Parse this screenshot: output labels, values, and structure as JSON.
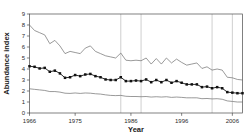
{
  "chart_data": {
    "type": "line",
    "title": "",
    "xlabel": "Year",
    "ylabel": "Abundance index",
    "xlim": [
      1966,
      2008
    ],
    "ylim": [
      0,
      9
    ],
    "grid": "vertical",
    "legend": "none",
    "x": [
      1966,
      1967,
      1968,
      1969,
      1970,
      1971,
      1972,
      1973,
      1974,
      1975,
      1976,
      1977,
      1978,
      1979,
      1980,
      1981,
      1982,
      1983,
      1984,
      1985,
      1986,
      1987,
      1988,
      1989,
      1990,
      1991,
      1992,
      1993,
      1994,
      1995,
      1996,
      1997,
      1998,
      1999,
      2000,
      2001,
      2002,
      2003,
      2004,
      2005,
      2006,
      2007,
      2008
    ],
    "xticks": [
      1966,
      1975,
      1986,
      1996,
      2006
    ],
    "xticklabels": [
      "1966",
      "1975",
      "1986",
      "1996",
      "2006"
    ],
    "yticks": [
      0,
      1,
      2,
      3,
      4,
      5,
      6,
      7,
      8,
      9
    ],
    "yticklabels": [
      "0",
      "1",
      "2",
      "3",
      "4",
      "5",
      "6",
      "7",
      "8",
      "9"
    ],
    "vertical_gridlines": [
      1984,
      1988,
      2002,
      2006
    ],
    "series": [
      {
        "name": "upper-confidence-bound",
        "marker": "none",
        "color": "#6e6e6e",
        "values": [
          8.0,
          7.5,
          7.3,
          7.1,
          6.3,
          6.6,
          6.1,
          5.4,
          5.6,
          5.5,
          5.4,
          5.9,
          6.1,
          5.6,
          5.4,
          5.2,
          5.1,
          5.0,
          5.45,
          4.8,
          4.75,
          4.8,
          4.75,
          5.0,
          4.45,
          4.95,
          4.45,
          5.0,
          4.55,
          4.9,
          4.6,
          4.35,
          4.45,
          4.55,
          4.05,
          4.2,
          3.9,
          4.0,
          3.9,
          3.25,
          3.2,
          3.05,
          3.0
        ]
      },
      {
        "name": "abundance-index-estimate",
        "marker": "filled-square",
        "color": "#111111",
        "values": [
          4.25,
          4.2,
          4.05,
          4.1,
          3.75,
          3.85,
          3.6,
          3.2,
          3.25,
          3.45,
          3.35,
          3.5,
          3.55,
          3.35,
          3.25,
          3.05,
          3.0,
          3.0,
          3.25,
          2.9,
          2.9,
          2.95,
          2.9,
          3.05,
          2.8,
          3.0,
          2.8,
          3.0,
          2.75,
          2.9,
          2.75,
          2.6,
          2.6,
          2.6,
          2.35,
          2.4,
          2.25,
          2.35,
          2.25,
          1.9,
          1.85,
          1.8,
          1.8
        ]
      },
      {
        "name": "lower-confidence-bound",
        "marker": "none",
        "color": "#6e6e6e",
        "values": [
          2.2,
          2.15,
          2.1,
          2.05,
          1.95,
          1.95,
          1.9,
          1.8,
          1.78,
          1.82,
          1.78,
          1.82,
          1.8,
          1.75,
          1.72,
          1.65,
          1.6,
          1.58,
          1.6,
          1.52,
          1.5,
          1.5,
          1.48,
          1.5,
          1.45,
          1.48,
          1.45,
          1.48,
          1.42,
          1.45,
          1.42,
          1.38,
          1.38,
          1.38,
          1.3,
          1.32,
          1.28,
          1.3,
          1.25,
          1.1,
          1.05,
          1.0,
          1.0
        ]
      }
    ]
  },
  "axes": {
    "y_title": "Abundance index",
    "x_title": "Year"
  }
}
